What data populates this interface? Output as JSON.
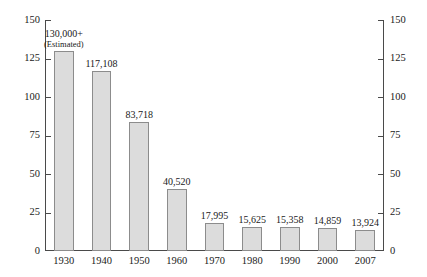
{
  "chart_data": {
    "type": "bar",
    "title": "",
    "subtitle": "",
    "xlabel": "",
    "ylabel": "",
    "categories": [
      "1930",
      "1940",
      "1950",
      "1960",
      "1970",
      "1980",
      "1990",
      "2000",
      "2007"
    ],
    "values": [
      130,
      117.108,
      83.718,
      40.52,
      17.995,
      15.625,
      15.358,
      14.859,
      13.924
    ],
    "data_labels": [
      "130,000+",
      "117,108",
      "83,718",
      "40,520",
      "17,995",
      "15,625",
      "15,358",
      "14,859",
      "13,924"
    ],
    "data_sublabels": [
      "(Estimated)",
      "",
      "",
      "",
      "",
      "",
      "",
      "",
      ""
    ],
    "ylim": [
      0,
      150
    ],
    "yticks": [
      0,
      25,
      50,
      75,
      100,
      125,
      150
    ],
    "ytick_labels": [
      "0",
      "25",
      "50",
      "75",
      "100",
      "125",
      "150"
    ],
    "y2lim": [
      0,
      150
    ],
    "y2ticks": [
      0,
      25,
      50,
      75,
      100,
      125,
      150
    ],
    "y2tick_labels": [
      "0",
      "25",
      "50",
      "75",
      "100",
      "125",
      "150"
    ],
    "grid": false,
    "legend": null,
    "units_note": "values plotted in thousands",
    "colors": {
      "bar_fill": "#dcdcdc",
      "bar_border": "#8c8c8c",
      "axis": "#4a4a4a",
      "text": "#1a1a1a",
      "background": "#ffffff"
    }
  }
}
